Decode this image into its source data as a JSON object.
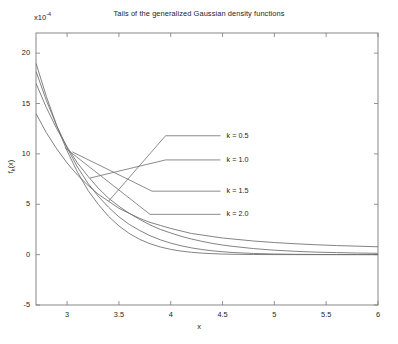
{
  "chart_data": {
    "type": "line",
    "title": "Tails of the generalized Gaussian density functions",
    "xlabel": "x",
    "ylabel": "f",
    "ylabel_sub": "k",
    "ylabel_suffix": "(x)",
    "y_exponent_prefix": "x10",
    "y_exponent": "-4",
    "xlim": [
      2.7,
      6.0
    ],
    "ylim": [
      -5,
      22
    ],
    "xticks": [
      3,
      3.5,
      4,
      4.5,
      5,
      5.5,
      6
    ],
    "xtick_labels": [
      "3",
      "3.5",
      "4",
      "4.5",
      "5",
      "5.5",
      "6"
    ],
    "yticks": [
      -5,
      0,
      5,
      10,
      15,
      20
    ],
    "ytick_labels": [
      "-5",
      "0",
      "5",
      "10",
      "15",
      "20"
    ],
    "grid": false,
    "legend_position": "inline-annotations",
    "line_color": "#6d6d6d",
    "axis_color": "#7a7a7a",
    "series": [
      {
        "name": "k = 0.5",
        "label": "k = 0.5",
        "anchor_x": 3.95,
        "anchor_y": 11.8,
        "x": [
          2.7,
          2.8,
          2.9,
          3.0,
          3.1,
          3.2,
          3.3,
          3.4,
          3.5,
          3.6,
          3.7,
          3.8,
          3.9,
          4.0,
          4.1,
          4.2,
          4.3,
          4.4,
          4.5,
          4.6,
          4.8,
          5.0,
          5.2,
          5.4,
          5.6,
          5.8,
          6.0
        ],
        "y": [
          14.0,
          12.1,
          10.5,
          9.1,
          7.9,
          6.9,
          6.0,
          5.3,
          4.6,
          4.1,
          3.6,
          3.2,
          2.9,
          2.6,
          2.35,
          2.1,
          1.95,
          1.8,
          1.65,
          1.55,
          1.35,
          1.2,
          1.08,
          0.98,
          0.9,
          0.84,
          0.78
        ]
      },
      {
        "name": "k = 1.0",
        "label": "k = 1.0",
        "anchor_x": 3.95,
        "anchor_y": 9.4,
        "x": [
          2.7,
          2.8,
          2.9,
          3.0,
          3.1,
          3.2,
          3.3,
          3.4,
          3.5,
          3.6,
          3.7,
          3.8,
          3.9,
          4.0,
          4.1,
          4.2,
          4.3,
          4.4,
          4.5,
          4.6,
          4.8,
          5.0,
          5.2,
          5.4,
          5.6,
          5.8,
          6.0
        ],
        "y": [
          17.0,
          14.6,
          12.5,
          10.7,
          9.1,
          7.8,
          6.6,
          5.6,
          4.8,
          4.1,
          3.5,
          2.95,
          2.5,
          2.15,
          1.82,
          1.55,
          1.32,
          1.12,
          0.95,
          0.82,
          0.6,
          0.44,
          0.33,
          0.25,
          0.2,
          0.16,
          0.13
        ]
      },
      {
        "name": "k = 1.5",
        "label": "k = 1.5",
        "anchor_x": 3.82,
        "anchor_y": 6.3,
        "x": [
          2.7,
          2.8,
          2.9,
          3.0,
          3.1,
          3.2,
          3.3,
          3.4,
          3.5,
          3.6,
          3.7,
          3.8,
          3.9,
          4.0,
          4.1,
          4.2,
          4.3,
          4.4,
          4.5,
          4.6,
          4.8,
          5.0,
          5.2,
          5.4,
          5.6,
          5.8,
          6.0
        ],
        "y": [
          18.2,
          15.3,
          12.8,
          10.6,
          8.7,
          7.1,
          5.8,
          4.7,
          3.75,
          3.0,
          2.4,
          1.88,
          1.47,
          1.14,
          0.88,
          0.67,
          0.51,
          0.38,
          0.29,
          0.21,
          0.115,
          0.062,
          0.032,
          0.016,
          0.008,
          0.004,
          0.002
        ]
      },
      {
        "name": "k = 2.0",
        "label": "k = 2.0",
        "anchor_x": 3.8,
        "anchor_y": 4.0,
        "x": [
          2.7,
          2.8,
          2.9,
          3.0,
          3.1,
          3.2,
          3.3,
          3.4,
          3.5,
          3.6,
          3.7,
          3.8,
          3.9,
          4.0,
          4.1,
          4.2,
          4.3,
          4.4,
          4.5,
          4.6,
          4.8,
          5.0,
          5.2,
          5.4,
          5.6,
          5.8,
          6.0
        ],
        "y": [
          19.0,
          15.7,
          12.8,
          10.3,
          8.2,
          6.4,
          5.0,
          3.8,
          2.85,
          2.1,
          1.52,
          1.08,
          0.76,
          0.52,
          0.35,
          0.23,
          0.15,
          0.095,
          0.059,
          0.036,
          0.012,
          0.004,
          0.001,
          0.0004,
          0.0001,
          3e-05,
          1e-05
        ]
      }
    ],
    "annotations": [
      {
        "label": "k = 0.5",
        "text_x": 4.52,
        "text_y": 11.8
      },
      {
        "label": "k = 1.0",
        "text_x": 4.52,
        "text_y": 9.4
      },
      {
        "label": "k = 1.5",
        "text_x": 4.52,
        "text_y": 6.3
      },
      {
        "label": "k = 2.0",
        "text_x": 4.52,
        "text_y": 4.0
      }
    ],
    "leader_lines": [
      {
        "from_x": 3.4,
        "from_y": 5.3,
        "elbow_x": 3.95,
        "elbow_y": 11.8,
        "to_x": 4.48,
        "to_y": 11.8
      },
      {
        "from_x": 3.22,
        "from_y": 7.6,
        "elbow_x": 3.95,
        "elbow_y": 9.4,
        "to_x": 4.48,
        "to_y": 9.4
      },
      {
        "from_x": 3.05,
        "from_y": 10.2,
        "elbow_x": 3.82,
        "elbow_y": 6.3,
        "to_x": 4.48,
        "to_y": 6.3
      },
      {
        "from_x": 2.98,
        "from_y": 10.6,
        "elbow_x": 3.8,
        "elbow_y": 4.0,
        "to_x": 4.48,
        "to_y": 4.0
      }
    ]
  }
}
